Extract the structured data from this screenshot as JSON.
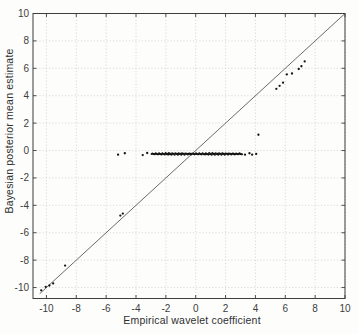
{
  "figure": {
    "xlabel": "Empirical wavelet coefficient",
    "ylabel": "Bayesian posterior mean estimate"
  },
  "colors": {
    "background": "#fdfdfc",
    "axis_frame": "#3d3d3d",
    "tick_label": "#3d3d3d",
    "grid": "#c9c9c9",
    "identity_line": "#5a5a5a",
    "marker": "#141414"
  },
  "chart_data": {
    "type": "scatter",
    "title": "",
    "xlabel": "Empirical wavelet coefficient",
    "ylabel": "Bayesian posterior mean estimate",
    "xlim": [
      -10.9,
      10
    ],
    "ylim": [
      -10.8,
      10
    ],
    "xticks": [
      -10,
      -8,
      -6,
      -4,
      -2,
      0,
      2,
      4,
      6,
      8,
      10
    ],
    "yticks": [
      -10,
      -8,
      -6,
      -4,
      -2,
      0,
      2,
      4,
      6,
      8,
      10
    ],
    "grid": true,
    "grid_style": "dotted",
    "legend": null,
    "identity_line": {
      "from": [
        -10.45,
        -10.45
      ],
      "to": [
        10,
        10
      ]
    },
    "series": [
      {
        "name": "small coefficients shrunk toward zero",
        "marker": "point",
        "dense_band": {
          "y": -0.25,
          "x_from": -2.95,
          "x_to": 3.1
        },
        "points": [
          [
            -5.2,
            -0.3
          ],
          [
            -4.75,
            -0.2
          ],
          [
            -3.55,
            -0.33
          ],
          [
            -3.25,
            -0.18
          ],
          [
            3.3,
            -0.3
          ],
          [
            3.6,
            -0.2
          ],
          [
            3.78,
            -0.3
          ],
          [
            4.05,
            -0.25
          ]
        ]
      },
      {
        "name": "large coefficients near identity line",
        "marker": "point",
        "points": [
          [
            -10.35,
            -10.2
          ],
          [
            -10.05,
            -9.95
          ],
          [
            -9.8,
            -9.85
          ],
          [
            -9.55,
            -9.7
          ],
          [
            -8.75,
            -8.4
          ],
          [
            -5.05,
            -4.75
          ],
          [
            -4.88,
            -4.6
          ],
          [
            4.2,
            1.15
          ],
          [
            5.4,
            4.5
          ],
          [
            5.62,
            4.72
          ],
          [
            5.85,
            4.95
          ],
          [
            6.1,
            5.55
          ],
          [
            6.45,
            5.62
          ],
          [
            6.9,
            5.95
          ],
          [
            7.08,
            6.15
          ],
          [
            7.3,
            6.5
          ]
        ]
      }
    ]
  }
}
